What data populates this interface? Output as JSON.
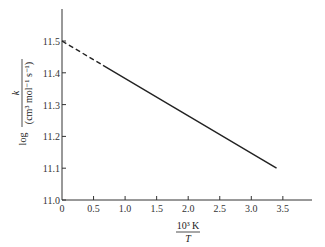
{
  "chart_data": {
    "type": "line",
    "title": "",
    "xlabel": "10^3 K / T",
    "xlabel_num": "10³ K",
    "xlabel_den": "T",
    "ylabel": "log k / (cm³ mol⁻¹ s⁻¹)",
    "ylabel_prefix": "log",
    "ylabel_num": "k",
    "ylabel_den": "(cm³ mol⁻¹ s⁻¹)",
    "xlim": [
      0,
      3.9
    ],
    "ylim": [
      11.0,
      11.6
    ],
    "x_ticks": [
      "0",
      "0.5",
      "1.0",
      "1.5",
      "2.0",
      "2.5",
      "3.0",
      "3.5"
    ],
    "x_tick_values": [
      0,
      0.5,
      1.0,
      1.5,
      2.0,
      2.5,
      3.0,
      3.5
    ],
    "y_ticks": [
      "11.0",
      "11.1",
      "11.2",
      "11.3",
      "11.4",
      "11.5"
    ],
    "y_tick_values": [
      11.0,
      11.1,
      11.2,
      11.3,
      11.4,
      11.5
    ],
    "grid": false,
    "legend": null,
    "series": [
      {
        "name": "extrapolated (dashed)",
        "style": "dashed",
        "x": [
          0,
          0.65
        ],
        "y": [
          11.5,
          11.4235
        ]
      },
      {
        "name": "measured (solid)",
        "style": "solid",
        "x": [
          0.65,
          3.4
        ],
        "y": [
          11.4235,
          11.1
        ]
      }
    ],
    "line_color": "#222222"
  }
}
